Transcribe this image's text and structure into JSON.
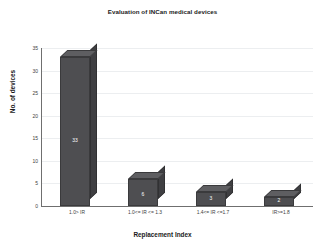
{
  "chart_data": {
    "type": "bar",
    "title": "Evaluation of INCan medical devices",
    "xlabel": "Replacement Index",
    "ylabel": "No. of devices",
    "categories": [
      "1.0> IR",
      "1.0<= IR <= 1.3",
      "1.4<= IR <=1.7",
      "IR>=1.8"
    ],
    "values": [
      33,
      6,
      3,
      2
    ],
    "ylim": [
      0,
      35
    ],
    "ytick_labels": [
      "35",
      "30",
      "25",
      "20",
      "15",
      "10",
      "5",
      "0"
    ],
    "ytick_values": [
      35,
      30,
      25,
      20,
      15,
      10,
      5,
      0
    ],
    "grid": true,
    "legend": "none",
    "bar_color": "#4e4e51",
    "bar_top_color": "#5e5e61",
    "bar_side_color": "#3f3f42",
    "grid_color": "#eceef0",
    "axis_color": "#6f6f6f",
    "data_label_color": "#ffffff",
    "data_labels": [
      "33",
      "6",
      "3",
      "2"
    ]
  }
}
